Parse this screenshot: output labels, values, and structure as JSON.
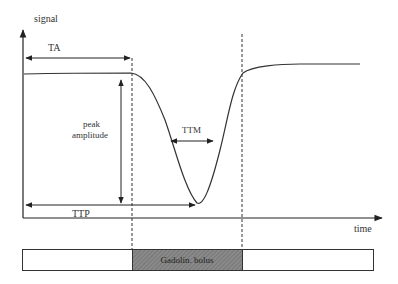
{
  "diagram": {
    "y_axis_label": "signal",
    "x_axis_label": "time",
    "annotations": {
      "ta": "TA",
      "peak_amplitude_line1": "peak",
      "peak_amplitude_line2": "amplitude",
      "ttm": "TTM",
      "ttp": "TTP"
    },
    "bolus_label": "Gadolin. bolus",
    "colors": {
      "line": "#333333",
      "bolus_fill": "#7a7a7a",
      "background": "#ffffff"
    }
  }
}
